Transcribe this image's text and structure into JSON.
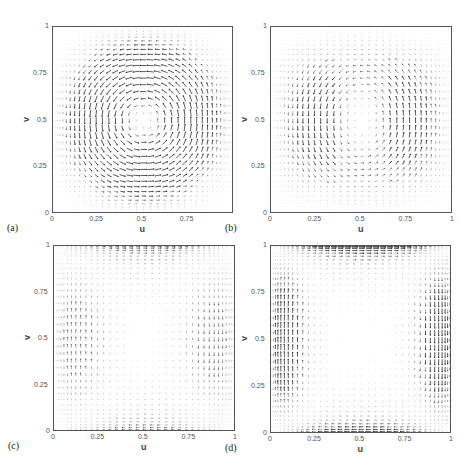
{
  "figure": {
    "width": 474,
    "height": 469
  },
  "chart_data": [
    {
      "type": "quiver",
      "panel_label": "(a)",
      "xlabel": "u",
      "ylabel": "v",
      "xlim": [
        0,
        1
      ],
      "ylim": [
        0,
        1
      ],
      "xticks": [
        "0",
        "0.25",
        "0.5",
        "0.75"
      ],
      "yticks": [
        "0",
        "0.25",
        "0.5",
        "0.75",
        "1"
      ],
      "description": "single vortex centered at (0.5, 0.5), strong circulating flow, dense grid near walls",
      "field": {
        "mode": "vortex",
        "cx": 0.5,
        "cy": 0.5,
        "strength": 1.0
      },
      "frame": {
        "left": 52,
        "top": 26,
        "width": 181,
        "height": 187
      }
    },
    {
      "type": "quiver",
      "panel_label": "(b)",
      "xlabel": "u",
      "ylabel": "v",
      "xlim": [
        0,
        1
      ],
      "ylim": [
        0,
        1
      ],
      "xticks": [
        "0",
        "0.25",
        "0.5",
        "0.75",
        "1"
      ],
      "yticks": [
        "0",
        "0.25",
        "0.5",
        "0.75",
        "1"
      ],
      "description": "broad central vortex, vertical flow concentrated near x=0.1 (up) and x=0.9 (down), weak center",
      "field": {
        "mode": "vortex-wide",
        "cx": 0.5,
        "cy": 0.5,
        "strength": 0.7
      },
      "frame": {
        "left": 270,
        "top": 26,
        "width": 182,
        "height": 187
      }
    },
    {
      "type": "quiver",
      "panel_label": "(c)",
      "xlabel": "u",
      "ylabel": "v",
      "xlim": [
        0,
        1
      ],
      "ylim": [
        0,
        1
      ],
      "xticks": [
        "0",
        "0.25",
        "0.5",
        "0.75",
        "1"
      ],
      "yticks": [
        "0",
        "0.25",
        "0.5",
        "0.75",
        "1"
      ],
      "description": "flow concentrated near left and right walls, nearly stagnant interior",
      "field": {
        "mode": "wall",
        "cx": 0.5,
        "cy": 0.5,
        "strength": 0.6,
        "wall": 0.12
      },
      "frame": {
        "left": 53,
        "top": 245,
        "width": 182,
        "height": 186
      }
    },
    {
      "type": "quiver",
      "panel_label": "(d)",
      "xlabel": "u",
      "ylabel": "v",
      "xlim": [
        0,
        1
      ],
      "ylim": [
        0,
        1
      ],
      "xticks": [
        "0",
        "0.25",
        "0.5",
        "0.75",
        "1"
      ],
      "yticks": [
        "0",
        "0.25",
        "0.5",
        "0.75",
        "1"
      ],
      "description": "thin boundary layers along left and right walls with corner vortices, stagnant core",
      "field": {
        "mode": "wall",
        "cx": 0.5,
        "cy": 0.5,
        "strength": 1.0,
        "wall": 0.07
      },
      "frame": {
        "left": 270,
        "top": 245,
        "width": 181,
        "height": 188
      }
    }
  ]
}
